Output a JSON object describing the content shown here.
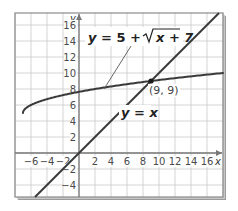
{
  "chart_data": {
    "type": "line",
    "title": "",
    "xlabel": "x",
    "ylabel": "y",
    "xlim": [
      -8,
      18
    ],
    "ylim": [
      -5.5,
      17.5
    ],
    "grid": true,
    "grid_step": 2,
    "x_ticks": [
      -6,
      -4,
      -2,
      2,
      4,
      6,
      8,
      10,
      12,
      14,
      16
    ],
    "y_ticks": [
      -4,
      -2,
      2,
      4,
      6,
      8,
      10,
      12,
      14,
      16
    ],
    "series": [
      {
        "name": "y = 5 + √(x + 7)",
        "function": "5 + sqrt(x + 7)",
        "domain": [
          -7,
          18
        ],
        "points": [
          [
            -7,
            5
          ],
          [
            -6,
            6
          ],
          [
            -3,
            7
          ],
          [
            2,
            8
          ],
          [
            9,
            9
          ],
          [
            18,
            10
          ]
        ]
      },
      {
        "name": "y = x",
        "function": "x",
        "domain": [
          -5.5,
          17.5
        ],
        "points": [
          [
            -5.5,
            -5.5
          ],
          [
            0,
            0
          ],
          [
            9,
            9
          ],
          [
            17.5,
            17.5
          ]
        ]
      }
    ],
    "annotations": [
      {
        "type": "point",
        "x": 9,
        "y": 9,
        "label": "(9, 9)"
      },
      {
        "type": "label",
        "text": "y = 5 + √(x + 7)",
        "target_series": 0
      },
      {
        "type": "label",
        "text": "y = x",
        "target_series": 1
      }
    ],
    "legend": "none"
  },
  "labels": {
    "x_axis": "x",
    "y_axis": "y",
    "curve_eq_prefix": "y = 5 + ",
    "curve_eq_radicand": "x + 7",
    "line_eq_y": "y",
    "line_eq_rest": " = ",
    "line_eq_x": "x",
    "intersection": "(9, 9)"
  }
}
